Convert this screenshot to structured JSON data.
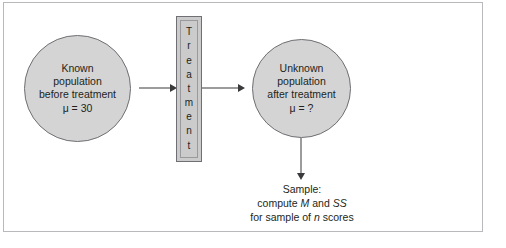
{
  "figure": {
    "background_color": "#ffffff",
    "frame_color": "#b9b9bd",
    "shape_fill": "#d4d4d4",
    "shape_stroke": "#6f6f74",
    "text_color": "#231f20",
    "arrow_color": "#3a3a3c"
  },
  "population_before": {
    "line1": "Known",
    "line2": "population",
    "line3": "before treatment",
    "parameter": "μ = 30"
  },
  "treatment": {
    "label": "Treatment",
    "letters": [
      "T",
      "r",
      "e",
      "a",
      "t",
      "m",
      "e",
      "n",
      "t"
    ]
  },
  "population_after": {
    "line1": "Unknown",
    "line2": "population",
    "line3": "after treatment",
    "parameter": "μ = ?"
  },
  "sample": {
    "line1": "Sample:",
    "line2_prefix": "compute ",
    "line2_stat1": "M",
    "line2_middle": " and ",
    "line2_stat2": "SS",
    "line3_prefix": "for sample of ",
    "line3_var": "n",
    "line3_suffix": " scores"
  },
  "arrows": {
    "population_to_treatment": "right-arrow",
    "treatment_to_population": "right-arrow",
    "population_to_sample": "down-arrow"
  }
}
